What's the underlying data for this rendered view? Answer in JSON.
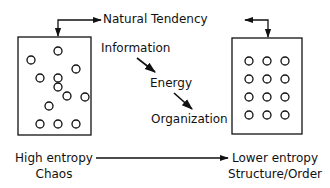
{
  "diagram": {
    "top_arrow_label": "Natural Tendency",
    "process_steps": [
      "Information",
      "Energy",
      "Organization"
    ],
    "left_state": {
      "line1": "High entropy",
      "line2": "Chaos"
    },
    "right_state": {
      "line1": "Lower entropy",
      "line2": "Structure/Order"
    },
    "left_box_particles": 14,
    "right_box_grid": {
      "rows": 4,
      "cols": 3
    },
    "colors": {
      "stroke": "#111111",
      "background": "#ffffff"
    }
  }
}
